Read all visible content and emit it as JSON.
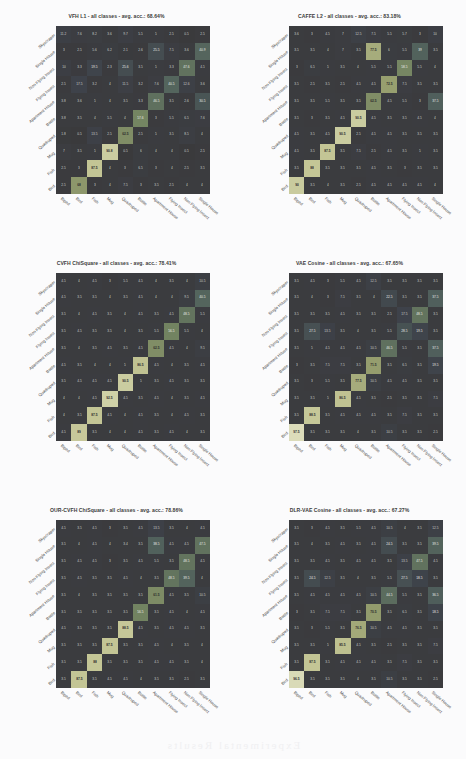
{
  "figure": {
    "classes": [
      "Biped",
      "Bird",
      "Fish",
      "Mug",
      "Quadruped",
      "Bottle",
      "Apartment House",
      "Flying Insect",
      "Non Flying Insect",
      "Single House",
      "Skyscraper"
    ],
    "row_classes": [
      "Skyscraper",
      "Single House",
      "Non Flying Insect",
      "Flying Insect",
      "Apartment House",
      "Bottle",
      "Quadruped",
      "Mug",
      "Fish",
      "Bird",
      "Biped"
    ],
    "bleed_text": "Experimental Results"
  },
  "chart_data": [
    {
      "type": "heatmap",
      "title": "VFH L1 - all classes - avg. acc.: 68.64%",
      "method": "VFH L1",
      "subtitle": "all classes",
      "avg_acc": 68.64,
      "xlabel": "",
      "ylabel": "",
      "categories": [
        "Biped",
        "Bird",
        "Fish",
        "Mug",
        "Quadruped",
        "Bottle",
        "Apartment House",
        "Flying Insect",
        "Non Flying Insect",
        "Single House",
        "Skyscraper"
      ],
      "row_order_top_to_bottom": [
        "Skyscraper",
        "Single House",
        "Non Flying Insect",
        "Flying Insect",
        "Apartment House",
        "Bottle",
        "Quadruped",
        "Mug",
        "Fish",
        "Bird",
        "Biped"
      ],
      "values": [
        [
          11.2,
          7.6,
          8.2,
          3.6,
          9.7,
          5.5,
          5.0,
          2.5,
          0.5,
          2.5,
          60.2
        ],
        [
          3.0,
          2.5,
          5.6,
          6.2,
          2.1,
          2.6,
          25.5,
          7.5,
          3.6,
          40.9,
          10.9
        ],
        [
          10.0,
          3.3,
          19.5,
          2.3,
          25.6,
          3.5,
          5.0,
          3.3,
          47.6,
          4.5,
          3.8
        ],
        [
          2.5,
          17.5,
          3.2,
          4.0,
          11.5,
          3.2,
          7.6,
          40.5,
          12.6,
          3.6,
          5.5
        ],
        [
          3.8,
          3.6,
          5.0,
          4.0,
          3.5,
          3.3,
          46.5,
          3.5,
          2.6,
          30.5,
          5.5
        ],
        [
          3.8,
          3.5,
          4.0,
          5.5,
          4.0,
          57.6,
          3.0,
          5.5,
          6.5,
          7.6,
          17.6
        ],
        [
          1.8,
          0.5,
          13.5,
          2.5,
          62.5,
          2.5,
          5.0,
          3.5,
          8.5,
          4.0,
          5.5
        ],
        [
          7.0,
          3.5,
          5.0,
          90.8,
          0.5,
          6.0,
          4.0,
          4.0,
          0.5,
          2.5,
          2.5
        ],
        [
          2.5,
          3.0,
          87.5,
          4.0,
          3.0,
          6.5,
          3.0,
          4.0,
          2.5,
          3.5,
          4.0
        ],
        [
          2.5,
          68.0,
          3.0,
          4.0,
          7.5,
          3.0,
          3.5,
          2.5,
          4.0,
          4.0,
          6.5
        ],
        [
          92.5,
          1.5,
          3.0,
          5.0,
          3.0,
          6.5,
          3.5,
          3.5,
          5.0,
          3.5,
          2.5
        ]
      ]
    },
    {
      "type": "heatmap",
      "title": "CAFFE L2 - all classes - avg. acc.: 83.18%",
      "method": "CAFFE L2",
      "subtitle": "all classes",
      "avg_acc": 83.18,
      "xlabel": "",
      "ylabel": "",
      "categories": [
        "Biped",
        "Bird",
        "Fish",
        "Mug",
        "Quadruped",
        "Bottle",
        "Apartment House",
        "Flying Insect",
        "Non Flying Insect",
        "Single House",
        "Skyscraper"
      ],
      "row_order_top_to_bottom": [
        "Skyscraper",
        "Single House",
        "Non Flying Insect",
        "Flying Insect",
        "Apartment House",
        "Bottle",
        "Quadruped",
        "Mug",
        "Fish",
        "Bird",
        "Biped"
      ],
      "values": [
        [
          3.6,
          3.0,
          4.5,
          7.0,
          12.5,
          7.5,
          5.5,
          5.7,
          3.0,
          10.0,
          39.5
        ],
        [
          3.5,
          3.5,
          4.0,
          7.0,
          3.5,
          77.5,
          6.0,
          5.5,
          39.0,
          3.5,
          3.5
        ],
        [
          3.0,
          6.5,
          5.0,
          3.5,
          4.0,
          5.5,
          5.5,
          58.5,
          5.5,
          4.0,
          3.0
        ],
        [
          3.5,
          2.5,
          3.5,
          2.5,
          4.5,
          4.5,
          72.5,
          7.5,
          3.5,
          3.5,
          2.5
        ],
        [
          3.5,
          3.5,
          5.5,
          3.5,
          3.5,
          62.5,
          4.5,
          5.5,
          3.0,
          37.5,
          10.0
        ],
        [
          3.5,
          3.0,
          3.5,
          4.5,
          90.5,
          4.5,
          3.5,
          3.5,
          4.5,
          4.0,
          3.5
        ],
        [
          4.5,
          3.5,
          4.5,
          90.5,
          2.5,
          4.5,
          4.5,
          3.5,
          3.5,
          3.5,
          4.5
        ],
        [
          4.5,
          3.5,
          87.5,
          3.5,
          7.5,
          2.5,
          4.5,
          3.5,
          5.0,
          3.5,
          3.5
        ],
        [
          3.5,
          88.0,
          3.5,
          3.5,
          3.5,
          4.5,
          3.5,
          3.0,
          3.5,
          3.5,
          3.5
        ],
        [
          90.0,
          3.5,
          4.0,
          3.5,
          2.5,
          4.5,
          4.5,
          4.5,
          4.5,
          4.0,
          3.5
        ],
        [
          97.5,
          3.0,
          3.5,
          3.0,
          2.5,
          3.5,
          3.5,
          3.5,
          4.0,
          3.0,
          2.5
        ]
      ]
    },
    {
      "type": "heatmap",
      "title": "CVFH ChiSquare - all classes - avg. acc.: 78.41%",
      "method": "CVFH ChiSquare",
      "subtitle": "all classes",
      "avg_acc": 78.41,
      "xlabel": "",
      "ylabel": "",
      "categories": [
        "Biped",
        "Bird",
        "Fish",
        "Mug",
        "Quadruped",
        "Bottle",
        "Apartment House",
        "Flying Insect",
        "Non Flying Insect",
        "Single House",
        "Skyscraper"
      ],
      "row_order_top_to_bottom": [
        "Skyscraper",
        "Single House",
        "Non Flying Insect",
        "Flying Insect",
        "Apartment House",
        "Bottle",
        "Quadruped",
        "Mug",
        "Fish",
        "Bird",
        "Biped"
      ],
      "values": [
        [
          4.5,
          4.0,
          4.5,
          3.0,
          5.5,
          4.5,
          4.0,
          3.5,
          4.0,
          10.5,
          74.0
        ],
        [
          4.5,
          3.5,
          3.5,
          4.0,
          3.5,
          4.5,
          4.0,
          4.0,
          9.5,
          40.5,
          5.5
        ],
        [
          3.5,
          4.0,
          4.5,
          3.5,
          4.0,
          4.5,
          3.5,
          4.5,
          48.5,
          5.5,
          3.5
        ],
        [
          3.5,
          4.5,
          3.5,
          3.5,
          4.0,
          3.5,
          5.5,
          56.5,
          5.5,
          4.0,
          3.5
        ],
        [
          3.5,
          4.0,
          3.5,
          4.5,
          3.5,
          4.5,
          62.5,
          4.5,
          4.0,
          9.5,
          4.5
        ],
        [
          4.5,
          3.5,
          4.0,
          4.0,
          5.0,
          86.5,
          4.5,
          4.0,
          3.5,
          4.5,
          3.5
        ],
        [
          3.5,
          4.5,
          4.5,
          4.5,
          90.5,
          5.0,
          3.5,
          4.5,
          3.5,
          3.5,
          4.0
        ],
        [
          4.0,
          4.0,
          4.5,
          92.5,
          4.5,
          3.5,
          4.5,
          4.0,
          3.5,
          4.5,
          3.5
        ],
        [
          4.0,
          3.5,
          87.5,
          4.5,
          4.0,
          4.5,
          3.5,
          4.0,
          4.5,
          3.5,
          4.0
        ],
        [
          4.5,
          89.0,
          3.5,
          4.0,
          4.0,
          4.5,
          3.5,
          4.5,
          4.0,
          3.5,
          4.5
        ],
        [
          92.5,
          3.5,
          4.0,
          4.5,
          3.5,
          4.5,
          4.5,
          3.5,
          4.0,
          4.5,
          3.5
        ]
      ]
    },
    {
      "type": "heatmap",
      "title": "VAE Cosine - all classes - avg. acc.: 67.65%",
      "method": "VAE Cosine",
      "subtitle": "all classes",
      "avg_acc": 67.65,
      "xlabel": "",
      "ylabel": "",
      "categories": [
        "Biped",
        "Bird",
        "Fish",
        "Mug",
        "Quadruped",
        "Bottle",
        "Apartment House",
        "Flying Insect",
        "Non Flying Insect",
        "Single House",
        "Skyscraper"
      ],
      "row_order_top_to_bottom": [
        "Skyscraper",
        "Single House",
        "Non Flying Insect",
        "Flying Insect",
        "Apartment House",
        "Bottle",
        "Quadruped",
        "Mug",
        "Fish",
        "Bird",
        "Biped"
      ],
      "values": [
        [
          3.5,
          4.5,
          3.0,
          5.5,
          4.5,
          12.5,
          3.5,
          3.5,
          3.5,
          3.5,
          53.0
        ],
        [
          3.5,
          4.0,
          3.0,
          7.5,
          3.5,
          4.0,
          22.5,
          3.5,
          3.5,
          37.5,
          12.0
        ],
        [
          3.5,
          3.5,
          3.5,
          4.5,
          3.5,
          3.5,
          2.5,
          17.5,
          48.5,
          3.5,
          7.0
        ],
        [
          3.5,
          27.5,
          13.5,
          3.5,
          4.0,
          3.5,
          5.5,
          28.5,
          19.5,
          3.5,
          4.0
        ],
        [
          3.5,
          5.0,
          4.5,
          4.5,
          4.5,
          10.5,
          46.5,
          5.5,
          3.5,
          37.5,
          3.5
        ],
        [
          3.0,
          3.5,
          7.5,
          7.5,
          3.5,
          71.5,
          3.5,
          6.5,
          3.5,
          19.5,
          10.5
        ],
        [
          3.5,
          3.0,
          5.5,
          3.5,
          77.5,
          10.5,
          4.5,
          4.5,
          3.5,
          3.5,
          2.5
        ],
        [
          3.5,
          3.5,
          5.0,
          86.5,
          4.5,
          3.5,
          2.5,
          3.5,
          3.5,
          7.5,
          4.0
        ],
        [
          3.5,
          88.5,
          3.5,
          4.5,
          4.5,
          4.5,
          3.5,
          7.5,
          3.5,
          3.5,
          3.5
        ],
        [
          97.5,
          3.5,
          3.5,
          3.5,
          4.0,
          3.5,
          10.5,
          3.5,
          3.5,
          2.5,
          2.5
        ],
        [
          90.5,
          3.5,
          3.5,
          3.5,
          4.0,
          3.5,
          4.5,
          3.5,
          3.5,
          3.5,
          2.5
        ]
      ]
    },
    {
      "type": "heatmap",
      "title": "OUR-CVFH ChiSquare - all classes - avg. acc.: 78.86%",
      "method": "OUR-CVFH ChiSquare",
      "subtitle": "all classes",
      "avg_acc": 78.86,
      "xlabel": "",
      "ylabel": "",
      "categories": [
        "Biped",
        "Bird",
        "Fish",
        "Mug",
        "Quadruped",
        "Bottle",
        "Apartment House",
        "Flying Insect",
        "Non Flying Insect",
        "Single House",
        "Skyscraper"
      ],
      "row_order_top_to_bottom": [
        "Skyscraper",
        "Single House",
        "Non Flying Insect",
        "Flying Insect",
        "Apartment House",
        "Bottle",
        "Quadruped",
        "Mug",
        "Fish",
        "Bird",
        "Biped"
      ],
      "values": [
        [
          4.5,
          3.5,
          4.5,
          3.0,
          3.5,
          4.5,
          13.5,
          3.5,
          4.0,
          4.5,
          77.5
        ],
        [
          3.5,
          4.0,
          4.5,
          4.0,
          3.4,
          3.5,
          38.5,
          4.5,
          4.5,
          47.5,
          4.5
        ],
        [
          3.5,
          4.5,
          4.5,
          3.0,
          3.5,
          4.5,
          5.5,
          3.5,
          48.5,
          4.5,
          4.0
        ],
        [
          3.5,
          4.5,
          3.5,
          3.5,
          4.5,
          4.0,
          3.5,
          48.5,
          39.5,
          4.0,
          3.5
        ],
        [
          3.5,
          4.0,
          3.5,
          3.5,
          3.5,
          3.5,
          61.5,
          4.5,
          3.5,
          10.5,
          4.5
        ],
        [
          3.5,
          3.5,
          3.5,
          3.5,
          3.5,
          56.5,
          3.5,
          4.5,
          4.0,
          4.5,
          3.5
        ],
        [
          4.5,
          3.5,
          3.5,
          3.5,
          88.5,
          4.5,
          3.5,
          4.5,
          4.5,
          3.5,
          4.0
        ],
        [
          3.5,
          3.5,
          3.5,
          87.5,
          3.5,
          3.5,
          4.5,
          4.0,
          3.5,
          4.0,
          3.5
        ],
        [
          3.5,
          3.5,
          88.0,
          3.5,
          3.5,
          3.5,
          4.5,
          4.5,
          3.5,
          4.0,
          3.5
        ],
        [
          3.5,
          87.5,
          3.5,
          4.5,
          4.5,
          4.0,
          3.5,
          3.5,
          2.5,
          3.5,
          4.5
        ],
        [
          92.5,
          3.5,
          3.5,
          4.0,
          4.5,
          3.5,
          3.5,
          4.5,
          3.5,
          4.0,
          3.5
        ]
      ]
    },
    {
      "type": "heatmap",
      "title": "DLR-VAE Cosine - all classes - avg. acc.: 67.27%",
      "method": "DLR-VAE Cosine",
      "subtitle": "all classes",
      "avg_acc": 67.27,
      "xlabel": "",
      "ylabel": "",
      "categories": [
        "Biped",
        "Bird",
        "Fish",
        "Mug",
        "Quadruped",
        "Bottle",
        "Apartment House",
        "Flying Insect",
        "Non Flying Insect",
        "Single House",
        "Skyscraper"
      ],
      "row_order_top_to_bottom": [
        "Skyscraper",
        "Single House",
        "Non Flying Insect",
        "Flying Insect",
        "Apartment House",
        "Bottle",
        "Quadruped",
        "Mug",
        "Fish",
        "Bird",
        "Biped"
      ],
      "values": [
        [
          3.5,
          3.0,
          4.5,
          3.5,
          5.5,
          4.5,
          10.5,
          4.0,
          3.5,
          12.5,
          52.5
        ],
        [
          3.5,
          4.0,
          3.5,
          4.5,
          3.5,
          4.5,
          24.5,
          3.5,
          3.5,
          39.5,
          10.5
        ],
        [
          3.5,
          3.5,
          4.5,
          3.5,
          4.5,
          4.5,
          3.5,
          13.5,
          47.5,
          4.5,
          7.5
        ],
        [
          3.5,
          24.5,
          12.5,
          3.5,
          4.0,
          3.5,
          5.5,
          27.5,
          18.5,
          3.5,
          4.5
        ],
        [
          3.5,
          4.5,
          4.5,
          4.5,
          4.5,
          10.5,
          44.5,
          5.5,
          3.5,
          36.5,
          3.5
        ],
        [
          3.0,
          3.5,
          7.5,
          7.5,
          3.5,
          70.5,
          3.5,
          6.5,
          3.5,
          18.5,
          10.5
        ],
        [
          3.5,
          3.0,
          5.5,
          3.5,
          76.5,
          10.5,
          4.5,
          4.5,
          3.5,
          3.5,
          2.5
        ],
        [
          3.5,
          3.5,
          5.0,
          85.5,
          4.5,
          3.5,
          2.5,
          3.5,
          3.5,
          7.5,
          4.0
        ],
        [
          3.5,
          87.5,
          3.5,
          4.5,
          4.5,
          4.5,
          3.5,
          7.5,
          3.5,
          3.5,
          3.5
        ],
        [
          96.5,
          3.5,
          3.5,
          3.5,
          4.0,
          3.5,
          10.5,
          3.5,
          3.5,
          2.5,
          2.5
        ],
        [
          90.0,
          3.5,
          3.5,
          3.5,
          4.0,
          3.5,
          4.5,
          3.5,
          3.5,
          3.5,
          2.5
        ]
      ]
    }
  ],
  "panels": [
    {
      "title": "VFH L1 - all classes - avg. acc.: 68.64%"
    },
    {
      "title": "CAFFE L2 - all classes - avg. acc.: 83.18%"
    },
    {
      "title": "CVFH ChiSquare - all classes - avg. acc.: 78.41%"
    },
    {
      "title": "VAE Cosine - all classes - avg. acc.: 67.65%"
    },
    {
      "title": "OUR-CVFH ChiSquare - all classes - avg. acc.: 78.86%"
    },
    {
      "title": "DLR-VAE Cosine - all classes - avg. acc.: 67.27%"
    }
  ]
}
